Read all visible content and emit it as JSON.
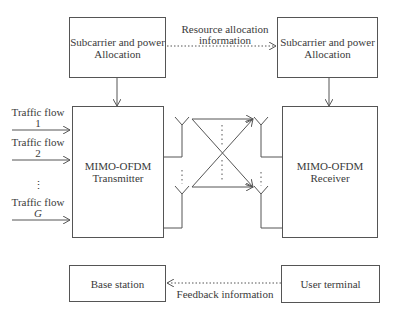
{
  "diagram": {
    "tx_alloc": {
      "line1": "Subcarrier and power",
      "line2": "Allocation"
    },
    "rx_alloc": {
      "line1": "Subcarrier and power",
      "line2": "Allocation"
    },
    "resource_info": {
      "line1": "Resource allocation",
      "line2": "information"
    },
    "transmitter": {
      "line1": "MIMO-OFDM",
      "line2": "Transmitter"
    },
    "receiver": {
      "line1": "MIMO-OFDM",
      "line2": "Receiver"
    },
    "flows": [
      {
        "label": "Traffic flow",
        "index": "1"
      },
      {
        "label": "Traffic flow",
        "index": "2"
      },
      {
        "label": "Traffic flow",
        "index": "G"
      }
    ],
    "flow_ellipsis": "⋮",
    "base_station": "Base station",
    "user_terminal": "User terminal",
    "feedback": "Feedback information"
  }
}
